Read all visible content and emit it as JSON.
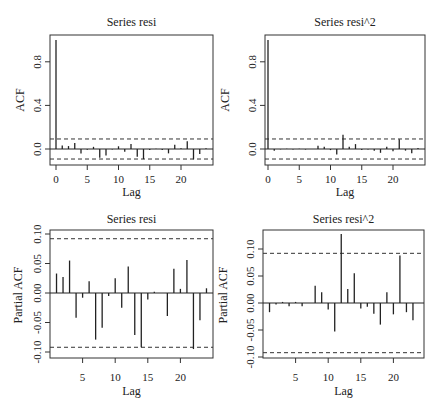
{
  "chart_data": [
    {
      "type": "bar",
      "title": "Series resi",
      "xlabel": "Lag",
      "ylabel": "ACF",
      "xticks": [
        0,
        5,
        10,
        15,
        20
      ],
      "yticks": [
        "0.0",
        "0.4",
        "0.8"
      ],
      "ytick_values": [
        0.0,
        0.4,
        0.8
      ],
      "ylim": [
        -0.14,
        1.0
      ],
      "xlim": [
        -1.5,
        24.5
      ],
      "conf_band": 0.092,
      "lags": [
        0,
        1,
        2,
        3,
        4,
        5,
        6,
        7,
        8,
        9,
        10,
        11,
        12,
        13,
        14,
        15,
        16,
        17,
        18,
        19,
        20,
        21,
        22,
        23,
        24
      ],
      "values": [
        1.0,
        0.033,
        0.027,
        0.055,
        -0.042,
        -0.008,
        0.02,
        -0.08,
        -0.06,
        -0.005,
        0.025,
        -0.025,
        0.045,
        -0.072,
        -0.093,
        -0.01,
        0.002,
        -0.01,
        -0.04,
        0.04,
        0.007,
        0.07,
        -0.095,
        -0.047,
        0.008
      ],
      "grid": false
    },
    {
      "type": "bar",
      "title": "Series resi^2",
      "xlabel": "Lag",
      "ylabel": "ACF",
      "xticks": [
        0,
        5,
        10,
        15,
        20
      ],
      "yticks": [
        "0.0",
        "0.4",
        "0.8"
      ],
      "ytick_values": [
        0.0,
        0.4,
        0.8
      ],
      "ylim": [
        -0.14,
        1.0
      ],
      "xlim": [
        -1.5,
        24.5
      ],
      "conf_band": 0.092,
      "lags": [
        0,
        1,
        2,
        3,
        4,
        5,
        6,
        7,
        8,
        9,
        10,
        11,
        12,
        13,
        14,
        15,
        16,
        17,
        18,
        19,
        20,
        21,
        22,
        23,
        24
      ],
      "values": [
        1.0,
        -0.015,
        -0.003,
        0.003,
        -0.005,
        0.002,
        -0.005,
        -0.001,
        0.03,
        0.02,
        -0.01,
        -0.05,
        0.13,
        0.02,
        0.045,
        -0.01,
        -0.005,
        -0.015,
        -0.035,
        0.02,
        -0.02,
        0.09,
        -0.015,
        -0.04,
        0.01
      ],
      "grid": false
    },
    {
      "type": "bar",
      "title": "Series resi",
      "xlabel": "Lag",
      "ylabel": "Partial ACF",
      "xticks": [
        5,
        10,
        15,
        20
      ],
      "yticks": [
        "-0.10",
        "-0.05",
        "0.00",
        "0.05",
        "0.10"
      ],
      "ytick_values": [
        -0.1,
        -0.05,
        0.0,
        0.05,
        0.1
      ],
      "ylim": [
        -0.1,
        0.1
      ],
      "xlim": [
        0,
        24.5
      ],
      "conf_band": 0.092,
      "lags": [
        1,
        2,
        3,
        4,
        5,
        6,
        7,
        8,
        9,
        10,
        11,
        12,
        13,
        14,
        15,
        16,
        17,
        18,
        19,
        20,
        21,
        22,
        23,
        24
      ],
      "values": [
        0.033,
        0.027,
        0.055,
        -0.042,
        -0.008,
        0.02,
        -0.079,
        -0.059,
        -0.005,
        0.025,
        -0.025,
        0.045,
        -0.071,
        -0.092,
        -0.011,
        0.002,
        0.0,
        -0.039,
        0.041,
        0.007,
        0.056,
        -0.095,
        -0.046,
        0.008
      ],
      "grid": false
    },
    {
      "type": "bar",
      "title": "Series resi^2",
      "xlabel": "Lag",
      "ylabel": "Partial ACF",
      "xticks": [
        5,
        10,
        15,
        20
      ],
      "yticks": [
        "-0.10",
        "-0.05",
        "0.00",
        "0.05",
        "0.10"
      ],
      "ytick_values": [
        -0.1,
        -0.05,
        0.0,
        0.05,
        0.1
      ],
      "ylim": [
        -0.1,
        0.128
      ],
      "xlim": [
        0,
        24.5
      ],
      "conf_band": 0.092,
      "lags": [
        1,
        2,
        3,
        4,
        5,
        6,
        7,
        8,
        9,
        10,
        11,
        12,
        13,
        14,
        15,
        16,
        17,
        18,
        19,
        20,
        21,
        22,
        23,
        24
      ],
      "values": [
        -0.017,
        -0.003,
        0.002,
        -0.006,
        0.002,
        -0.006,
        0.0,
        0.032,
        0.02,
        -0.012,
        -0.053,
        0.128,
        0.026,
        0.055,
        -0.01,
        -0.007,
        -0.02,
        -0.04,
        0.02,
        -0.021,
        0.088,
        -0.017,
        -0.032,
        0.0
      ],
      "grid": false
    }
  ]
}
